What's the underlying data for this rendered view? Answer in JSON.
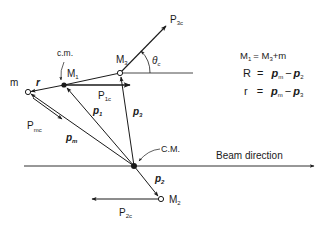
{
  "figure": {
    "title": "",
    "colors": {
      "ink": "#1a1a1a",
      "background": "#ffffff"
    },
    "points": {
      "m": {
        "label": "m"
      },
      "M1": {
        "label": "M",
        "sub": "1",
        "note": "c.m."
      },
      "M3": {
        "label": "M",
        "sub": "3"
      },
      "M2": {
        "label": "M",
        "sub": "2"
      },
      "CM": {
        "label": "C.M."
      }
    },
    "vectors": {
      "r": {
        "label": "r"
      },
      "p1": {
        "label": "p",
        "sub": "1"
      },
      "p3": {
        "label": "p",
        "sub": "3"
      },
      "pm": {
        "label": "p",
        "sub": "m"
      },
      "p2": {
        "label": "p",
        "sub": "2"
      },
      "P1c": {
        "label": "P",
        "sub": "1c"
      },
      "P3c": {
        "label": "P",
        "sub": "3c"
      },
      "P2c": {
        "label": "P",
        "sub": "2c"
      },
      "Pmc": {
        "label": "P",
        "sub": "mc"
      }
    },
    "angle": {
      "label": "θ",
      "sub": "c"
    },
    "beam": {
      "label": "Beam direction"
    },
    "equations": [
      {
        "lhs": "M",
        "lhs_sub": "1",
        "rhs": "= M",
        "rhs_sub": "3",
        "rest": "+m"
      },
      {
        "lhs": "R",
        "rhs": "=",
        "a": "p",
        "a_sub": "m",
        "op": "−",
        "b": "p",
        "b_sub": "2"
      },
      {
        "lhs": "r",
        "rhs": "=",
        "a": "p",
        "a_sub": "m",
        "op": "−",
        "b": "p",
        "b_sub": "3"
      }
    ]
  }
}
